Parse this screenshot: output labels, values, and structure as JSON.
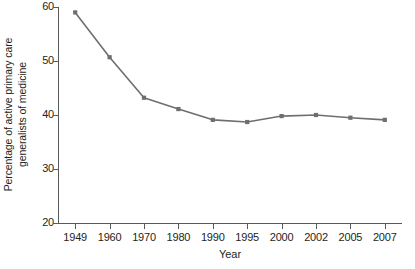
{
  "chart_data": {
    "type": "line",
    "title": "",
    "xlabel": "Year",
    "ylabel": "Percentage of active primary care generalists of medicine",
    "ylabel_lines": [
      "Percentage of active primary care",
      "generalists of medicine"
    ],
    "categories": [
      "1949",
      "1960",
      "1970",
      "1980",
      "1990",
      "1995",
      "2000",
      "2002",
      "2005",
      "2007"
    ],
    "values": [
      59.0,
      50.7,
      43.2,
      41.1,
      39.1,
      38.7,
      39.8,
      40.0,
      39.5,
      39.1
    ],
    "series": [
      {
        "name": "Percentage of active primary care generalists of medicine",
        "values": [
          59.0,
          50.7,
          43.2,
          41.1,
          39.1,
          38.7,
          39.8,
          40.0,
          39.5,
          39.1
        ]
      }
    ],
    "ylim": [
      20,
      60
    ],
    "yticks": [
      20,
      30,
      40,
      50,
      60
    ],
    "ytick_labels": [
      "20",
      "30",
      "40",
      "50",
      "60"
    ],
    "grid": false,
    "legend": false,
    "legend_position": "none",
    "marker": "square",
    "line_color": "#6e6e6e",
    "marker_color": "#6e6e6e",
    "axis_color": "#58595b",
    "background_color": "#ffffff"
  }
}
